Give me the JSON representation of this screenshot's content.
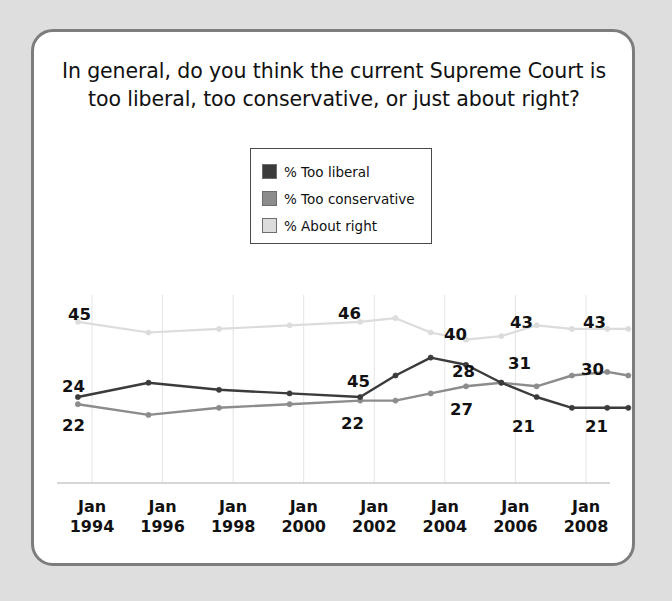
{
  "frame": {
    "border_color": "#7d7d7d",
    "background": "#ffffff",
    "page_background": "#dedede"
  },
  "title": {
    "line1": "In general, do you think the current Supreme Court is",
    "line2": "too liberal, too conservative, or just about right?"
  },
  "legend": {
    "items": [
      {
        "label": "% Too liberal",
        "color": "#3b3b3b"
      },
      {
        "label": "% Too conservative",
        "color": "#8c8c8c"
      },
      {
        "label": "% About right",
        "color": "#dcdcdc"
      }
    ]
  },
  "chart_data": {
    "type": "line",
    "title": "In general, do you think the current Supreme Court is too liberal, too conservative, or just about right?",
    "xlabel": "",
    "ylabel": "",
    "ylim": [
      0,
      60
    ],
    "grid": true,
    "legend_position": "top-center",
    "x_tick_labels": [
      {
        "month": "Jan",
        "year": "1994"
      },
      {
        "month": "Jan",
        "year": "1996"
      },
      {
        "month": "Jan",
        "year": "1998"
      },
      {
        "month": "Jan",
        "year": "2000"
      },
      {
        "month": "Jan",
        "year": "2002"
      },
      {
        "month": "Jan",
        "year": "2004"
      },
      {
        "month": "Jan",
        "year": "2006"
      },
      {
        "month": "Jan",
        "year": "2008"
      }
    ],
    "x": [
      1993.6,
      1995.6,
      1997.6,
      1999.6,
      2001.6,
      2002.6,
      2003.6,
      2004.6,
      2005.6,
      2006.6,
      2007.6,
      2008.6,
      2009.2
    ],
    "series": [
      {
        "name": "% Too liberal",
        "color": "#3b3b3b",
        "values": [
          24,
          28,
          26,
          25,
          24,
          30,
          35,
          33,
          28,
          24,
          21,
          21,
          21
        ]
      },
      {
        "name": "% Too conservative",
        "color": "#8c8c8c",
        "values": [
          22,
          19,
          21,
          22,
          23,
          23,
          25,
          27,
          28,
          27,
          30,
          31,
          30
        ]
      },
      {
        "name": "% About right",
        "color": "#dcdcdc",
        "values": [
          45,
          42,
          43,
          44,
          45,
          46,
          42,
          40,
          41,
          44,
          43,
          43,
          43
        ]
      }
    ],
    "point_labels": [
      {
        "text": "45",
        "series": "% About right",
        "x": 68,
        "y": 305
      },
      {
        "text": "46",
        "series": "% About right",
        "x": 338,
        "y": 304
      },
      {
        "text": "40",
        "series": "% About right",
        "x": 444,
        "y": 325
      },
      {
        "text": "43",
        "series": "% About right",
        "x": 510,
        "y": 313
      },
      {
        "text": "43",
        "series": "% About right",
        "x": 583,
        "y": 313
      },
      {
        "text": "24",
        "series": "% Too liberal",
        "x": 62,
        "y": 377
      },
      {
        "text": "45",
        "series": "% Too liberal",
        "x": 347,
        "y": 372
      },
      {
        "text": "28",
        "series": "% Too liberal",
        "x": 452,
        "y": 362
      },
      {
        "text": "21",
        "series": "% Too liberal",
        "x": 512,
        "y": 417
      },
      {
        "text": "21",
        "series": "% Too liberal",
        "x": 585,
        "y": 417
      },
      {
        "text": "22",
        "series": "% Too conservative",
        "x": 62,
        "y": 416
      },
      {
        "text": "22",
        "series": "% Too conservative",
        "x": 341,
        "y": 414
      },
      {
        "text": "27",
        "series": "% Too conservative",
        "x": 450,
        "y": 400
      },
      {
        "text": "31",
        "series": "% Too conservative",
        "x": 508,
        "y": 354
      },
      {
        "text": "30",
        "series": "% Too conservative",
        "x": 581,
        "y": 360
      }
    ]
  }
}
